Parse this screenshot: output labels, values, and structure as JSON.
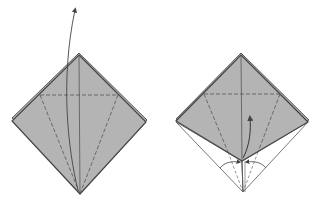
{
  "diagram": {
    "type": "origami-fold-steps",
    "colors": {
      "paper": "#b4b4b4",
      "edge": "#4a4a4a",
      "crease": "#555555",
      "background": "#ffffff"
    },
    "steps": [
      {
        "label": "step-1",
        "description": "Square base (preliminary fold); valley-fold creases shown; front flap lifted upward"
      },
      {
        "label": "step-2",
        "description": "Bottom edges folded in to center, then petal fold lifting flap upward"
      }
    ]
  }
}
